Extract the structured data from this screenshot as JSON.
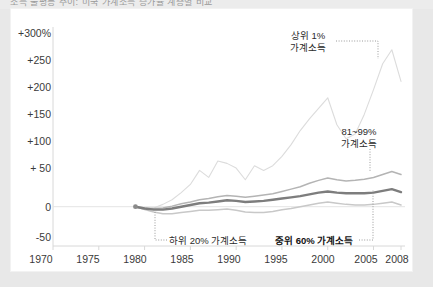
{
  "top_strip": {
    "cut_text": "소득 불평등 추이: 미국 가계소득 증가율 계층별 비교"
  },
  "chart_data": {
    "type": "line",
    "title": "",
    "xlabel": "",
    "ylabel": "",
    "xlim": [
      1970,
      2008
    ],
    "ylim": [
      -50,
      300
    ],
    "xticks": [
      "1970",
      "1975",
      "1980",
      "1985",
      "1990",
      "1995",
      "2000",
      "2005",
      "2008"
    ],
    "yticks": [
      "+300%",
      "+250",
      "+200",
      "+150",
      "+100",
      "+ 50",
      "0",
      "-50"
    ],
    "ytick_values": [
      300,
      250,
      200,
      150,
      100,
      50,
      0,
      -50
    ],
    "grid": false,
    "zero_line": true,
    "legend": "annotations",
    "series": [
      {
        "name": "상위 1% 가계소득",
        "label_line1": "상위 1%",
        "label_line2": "가계소득",
        "color": "#dcdcdc",
        "width": 1.1,
        "x": [
          1979,
          1980,
          1981,
          1982,
          1983,
          1984,
          1985,
          1986,
          1987,
          1988,
          1989,
          1990,
          1991,
          1992,
          1993,
          1994,
          1995,
          1996,
          1997,
          1998,
          1999,
          2000,
          2001,
          2002,
          2003,
          2004,
          2005,
          2006,
          2007,
          2008
        ],
        "y": [
          0,
          -4,
          -2,
          4,
          12,
          24,
          38,
          62,
          50,
          78,
          74,
          66,
          46,
          70,
          62,
          70,
          86,
          106,
          130,
          150,
          168,
          186,
          140,
          116,
          124,
          158,
          200,
          244,
          268,
          214
        ]
      },
      {
        "name": "81~99% 가계소득",
        "label_line1": "81~99%",
        "label_line2": "가계소득",
        "color": "#b4b4b4",
        "width": 1.5,
        "x": [
          1979,
          1980,
          1981,
          1982,
          1983,
          1984,
          1985,
          1986,
          1987,
          1988,
          1989,
          1990,
          1991,
          1992,
          1993,
          1994,
          1995,
          1996,
          1997,
          1998,
          1999,
          2000,
          2001,
          2002,
          2003,
          2004,
          2005,
          2006,
          2007,
          2008
        ],
        "y": [
          0,
          -2,
          -3,
          -2,
          1,
          5,
          8,
          12,
          14,
          17,
          19,
          18,
          16,
          18,
          20,
          22,
          26,
          30,
          34,
          40,
          45,
          49,
          46,
          44,
          45,
          47,
          50,
          55,
          60,
          55
        ]
      },
      {
        "name": "중위 60% 가계소득",
        "label_line1": "중위 60% 가계소득",
        "label_line2": "",
        "color": "#7d7d7d",
        "width": 2.4,
        "x": [
          1979,
          1980,
          1981,
          1982,
          1983,
          1984,
          1985,
          1986,
          1987,
          1988,
          1989,
          1990,
          1991,
          1992,
          1993,
          1994,
          1995,
          1996,
          1997,
          1998,
          1999,
          2000,
          2001,
          2002,
          2003,
          2004,
          2005,
          2006,
          2007,
          2008
        ],
        "y": [
          0,
          -3,
          -5,
          -5,
          -3,
          0,
          3,
          6,
          7,
          9,
          11,
          10,
          8,
          9,
          10,
          12,
          14,
          16,
          18,
          21,
          24,
          26,
          24,
          23,
          23,
          23,
          24,
          27,
          30,
          25
        ]
      },
      {
        "name": "하위 20% 가계소득",
        "label_line1": "하위 20% 가계소득",
        "label_line2": "",
        "color": "#c8c8c8",
        "width": 1.5,
        "x": [
          1979,
          1980,
          1981,
          1982,
          1983,
          1984,
          1985,
          1986,
          1987,
          1988,
          1989,
          1990,
          1991,
          1992,
          1993,
          1994,
          1995,
          1996,
          1997,
          1998,
          1999,
          2000,
          2001,
          2002,
          2003,
          2004,
          2005,
          2006,
          2007,
          2008
        ],
        "y": [
          0,
          -5,
          -9,
          -12,
          -12,
          -10,
          -8,
          -6,
          -6,
          -5,
          -4,
          -6,
          -9,
          -10,
          -10,
          -8,
          -5,
          -3,
          0,
          3,
          6,
          8,
          6,
          4,
          3,
          3,
          4,
          6,
          8,
          3
        ]
      }
    ],
    "start_marker": {
      "x": 1979,
      "y": 0
    }
  },
  "annotations": {
    "top1": {
      "line1": "상위 1%",
      "line2": "가계소득"
    },
    "p81_99": {
      "line1": "81~99%",
      "line2": "가계소득"
    },
    "bottom20": {
      "text": "하위 20% 가계소득"
    },
    "middle60": {
      "text": "중위 60% 가계소득"
    }
  },
  "colors": {
    "background": "#e8e8e8",
    "card": "#ffffff",
    "axis": "#d0d0d0",
    "text": "#3a3a3a"
  }
}
